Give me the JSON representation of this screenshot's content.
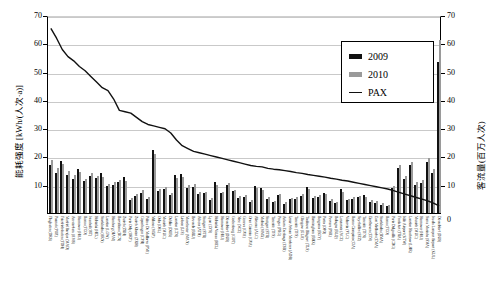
{
  "axes": {
    "left_title": "能耗强度 [kWh/(人次·a)]",
    "right_title": "客流量(百万人次)",
    "left_ticks": [
      "70",
      "60",
      "50",
      "40",
      "30",
      "20",
      "10",
      ""
    ],
    "right_ticks": [
      "70",
      "60",
      "50",
      "40",
      "30",
      "20",
      "10",
      ""
    ],
    "zero_label": "0"
  },
  "legend": {
    "items": [
      {
        "label": "2009",
        "type": "bar",
        "color": "#111111"
      },
      {
        "label": "2010",
        "type": "bar",
        "color": "#9a9a9a"
      },
      {
        "label": "PAX",
        "type": "line",
        "color": "#111111"
      }
    ]
  },
  "chart_data": {
    "type": "bar",
    "title": "",
    "xlabel": "",
    "ylabel": "能耗强度 [kWh/(人次·a)]",
    "y2label": "客流量(百万人次)",
    "ylim": [
      0,
      70
    ],
    "y2lim": [
      0,
      70
    ],
    "grid": true,
    "legend_position": "top-right",
    "categories": [
      "Flughafen (DRS)",
      "Poznań (POZ)",
      "Friedrichshafen (FDH)",
      "Madrid Barajas (MAD)",
      "Amsterdam (AMS)",
      "Hannover (HAJ)",
      "Roma (FCO)",
      "Istanbul (IST)",
      "Helsinki (HEL)",
      "Stockholm (ARN)",
      "London (LGW)",
      "Hamburg (HAM)",
      "Barcelona (BCN)",
      "Zurich (ZRH)",
      "Paris Orly (ORY)",
      "Zurich Kloten (ZRH)",
      "Copenhagen (CPH)",
      "Palma De Mallorca (PMI)",
      "Milano (MXP)",
      "Oslo (OSL)",
      "Munich (MUC)",
      "Dublin (DUB)",
      "London (LTN)",
      "Lisbon (LIS)",
      "Manchester (MAN)",
      "Brussels (BRU)",
      "Athens (ATH)",
      "Stuttgart (STR)",
      "Lyon (LYS)",
      "Helsinki Vantaa (HEL)",
      "Hannover (HAJ)",
      "Düsseldorf (DUS)",
      "Gothenburg (GOT)",
      "Nice (NCE)",
      "Geneva (GVA)",
      "Oran Cointrin (GVA)",
      "Alicante (ALC)",
      "Malmö (MMX)",
      "Stuttgart (STR)",
      "Tenerife (TFS)",
      "Prague (PRG)",
      "Ankara Esenboga (ESB)",
      "İzmir Adnan Menderes (ADB)",
      "Tenerife (TFS)",
      "Glasgow (GLA)",
      "Toulouse Blagnac (TLS)",
      "Birmingham (BHX)",
      "Bergamo (BGY)",
      "Porto (OPO)",
      "Pescara (PSR)",
      "Bologna (BLQ)",
      "Lanzarote (ACE)",
      "Valencia (VLC)",
      "Roma Ciampino (CIA)",
      "Seychelles (SEZ)",
      "Tenerife (TFN)",
      "Eindhoven (EIN)",
      "East Midlands (EMA)",
      "Stockholm (BMA)",
      "Roma (FCO)",
      "Paris Delgaulle (CDG)",
      "Frankfurt (FRA)",
      "Kiln Airport (KTW)",
      "London Heathrow (LHR)",
      "Munich (MUC)",
      "Hannover (HAJ)",
      "Santa Marinha (SMA)",
      "Kuala Lumpur Airport (KUL)",
      "Düsseldorf (DUS)"
    ],
    "series": [
      {
        "name": "2009",
        "color": "#111111",
        "values": [
          17.0,
          14.0,
          18.3,
          13.5,
          12.0,
          15.5,
          11.3,
          13.0,
          12.5,
          14.2,
          9.5,
          10.0,
          10.8,
          12.6,
          4.5,
          6.0,
          7.2,
          5.0,
          22.3,
          7.8,
          8.6,
          6.4,
          13.3,
          13.9,
          9.0,
          9.3,
          6.7,
          6.9,
          4.6,
          11.0,
          7.0,
          9.8,
          7.7,
          5.3,
          5.6,
          4.0,
          9.6,
          8.8,
          5.0,
          3.8,
          6.2,
          3.2,
          4.8,
          5.1,
          6.0,
          9.2,
          5.4,
          5.8,
          7.2,
          4.2,
          3.4,
          8.4,
          4.6,
          5.0,
          5.6,
          6.2,
          4.0,
          3.6,
          3.0,
          2.4,
          8.8,
          15.8,
          12.2,
          17.0,
          10.0,
          10.6,
          18.0,
          14.3,
          53.5
        ]
      },
      {
        "name": "2010",
        "color": "#9a9a9a",
        "values": [
          18.6,
          15.8,
          17.3,
          14.8,
          13.4,
          14.4,
          12.2,
          14.1,
          13.1,
          12.9,
          10.4,
          11.1,
          11.7,
          11.4,
          5.2,
          6.8,
          8.0,
          5.8,
          21.0,
          8.6,
          9.2,
          7.0,
          12.4,
          12.6,
          9.8,
          10.1,
          7.4,
          7.6,
          5.2,
          10.0,
          7.6,
          10.5,
          8.3,
          6.0,
          6.2,
          4.6,
          8.8,
          8.0,
          5.5,
          4.3,
          6.8,
          3.8,
          5.3,
          5.6,
          6.6,
          8.4,
          6.0,
          6.4,
          6.6,
          4.8,
          3.9,
          7.6,
          5.1,
          5.5,
          6.1,
          5.6,
          4.5,
          4.1,
          3.4,
          2.9,
          9.6,
          16.8,
          13.0,
          18.2,
          11.0,
          11.6,
          19.3,
          15.4,
          61.0
        ]
      }
    ],
    "pax_line": {
      "name": "PAX",
      "color": "#111111",
      "values": [
        66.0,
        62.5,
        58.5,
        56.0,
        54.5,
        52.5,
        51.0,
        49.0,
        47.0,
        45.0,
        44.0,
        41.0,
        37.0,
        36.5,
        36.0,
        34.5,
        33.0,
        32.0,
        31.5,
        31.0,
        30.5,
        29.0,
        26.5,
        24.5,
        23.5,
        22.5,
        22.0,
        21.5,
        21.0,
        20.5,
        20.0,
        19.5,
        19.0,
        18.5,
        18.0,
        17.5,
        17.2,
        17.0,
        16.5,
        16.2,
        16.0,
        15.7,
        15.4,
        15.0,
        14.7,
        14.3,
        14.0,
        13.7,
        13.4,
        13.0,
        12.7,
        12.3,
        12.0,
        11.6,
        11.2,
        10.8,
        10.4,
        10.0,
        9.6,
        9.2,
        8.6,
        8.0,
        7.4,
        6.8,
        6.2,
        5.6,
        5.0,
        4.2,
        3.2
      ]
    }
  }
}
